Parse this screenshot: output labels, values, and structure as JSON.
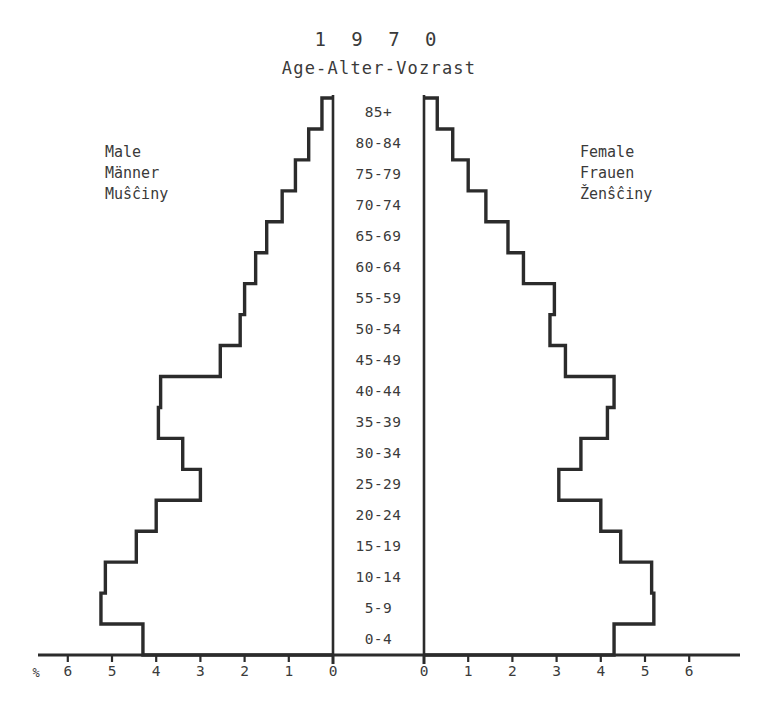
{
  "title": {
    "year": "1 9 7 0",
    "subtitle": "Age-Alter-Vozrast"
  },
  "legend": {
    "male": "Male\nMänner\nMuŝĉiny",
    "female": "Female\nFrauen\nŽenŝĉiny"
  },
  "axis": {
    "unit": "%",
    "left_ticks": [
      "6",
      "5",
      "4",
      "3",
      "2",
      "1",
      "0"
    ],
    "right_ticks": [
      "0",
      "1",
      "2",
      "3",
      "4",
      "5",
      "6"
    ]
  },
  "colors": {
    "ink": "#2b2b2b",
    "text": "#3a3a3a",
    "background": "#ffffff"
  },
  "chart_data": {
    "type": "bar",
    "title": "1 9 7 0",
    "subtitle": "Age-Alter-Vozrast",
    "orientation": "horizontal-pyramid",
    "xlabel": "%",
    "ylabel": "Age-Alter-Vozrast",
    "xlim": [
      0,
      6.5
    ],
    "grid": false,
    "legend_position": "sides",
    "categories": [
      "85+",
      "80-84",
      "75-79",
      "70-74",
      "65-69",
      "60-64",
      "55-59",
      "50-54",
      "45-49",
      "40-44",
      "35-39",
      "30-34",
      "25-29",
      "20-24",
      "15-19",
      "10-14",
      "5-9",
      "0-4"
    ],
    "series": [
      {
        "name": "Male",
        "side": "left",
        "values": [
          0.25,
          0.55,
          0.85,
          1.15,
          1.5,
          1.75,
          2.0,
          2.1,
          2.55,
          3.9,
          3.95,
          3.4,
          3.0,
          4.0,
          4.45,
          5.15,
          5.25,
          4.3
        ]
      },
      {
        "name": "Female",
        "side": "right",
        "values": [
          0.3,
          0.65,
          1.0,
          1.4,
          1.9,
          2.25,
          2.95,
          2.85,
          3.2,
          4.3,
          4.15,
          3.55,
          3.05,
          4.0,
          4.45,
          5.15,
          5.2,
          4.3
        ]
      }
    ]
  }
}
